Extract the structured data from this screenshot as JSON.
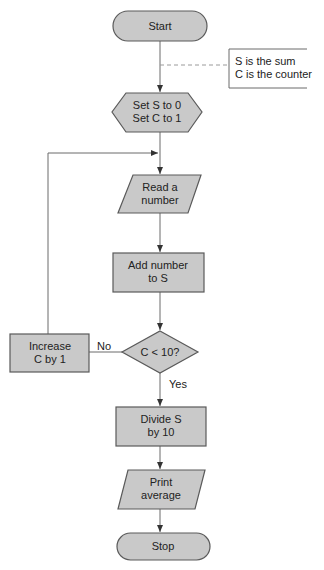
{
  "diagram": {
    "type": "flowchart",
    "colors": {
      "node_fill": "#c9c9c9",
      "node_stroke": "#5a5a5a",
      "edge": "#6a6a6a",
      "background": "#ffffff"
    },
    "nodes": [
      {
        "id": "start",
        "shape": "terminator",
        "lines": [
          "Start"
        ]
      },
      {
        "id": "init",
        "shape": "preparation",
        "lines": [
          "Set S to 0",
          "Set C to 1"
        ]
      },
      {
        "id": "read",
        "shape": "input-output",
        "lines": [
          "Read a",
          "number"
        ]
      },
      {
        "id": "add",
        "shape": "process",
        "lines": [
          "Add number",
          "to S"
        ]
      },
      {
        "id": "decision",
        "shape": "decision",
        "lines": [
          "C < 10?"
        ]
      },
      {
        "id": "increase",
        "shape": "process",
        "lines": [
          "Increase",
          "C by 1"
        ]
      },
      {
        "id": "divide",
        "shape": "process",
        "lines": [
          "Divide S",
          "by 10"
        ]
      },
      {
        "id": "print",
        "shape": "input-output",
        "lines": [
          "Print",
          "average"
        ]
      },
      {
        "id": "stop",
        "shape": "terminator",
        "lines": [
          "Stop"
        ]
      }
    ],
    "annotation": {
      "lines": [
        "S is the sum",
        "C is the counter"
      ]
    },
    "edges": [
      {
        "from": "start",
        "to": "init",
        "label": ""
      },
      {
        "from": "init",
        "to": "read",
        "label": ""
      },
      {
        "from": "read",
        "to": "add",
        "label": ""
      },
      {
        "from": "add",
        "to": "decision",
        "label": ""
      },
      {
        "from": "decision",
        "to": "increase",
        "label": "No"
      },
      {
        "from": "increase",
        "to": "read",
        "label": ""
      },
      {
        "from": "decision",
        "to": "divide",
        "label": "Yes"
      },
      {
        "from": "divide",
        "to": "print",
        "label": ""
      },
      {
        "from": "print",
        "to": "stop",
        "label": ""
      }
    ]
  }
}
